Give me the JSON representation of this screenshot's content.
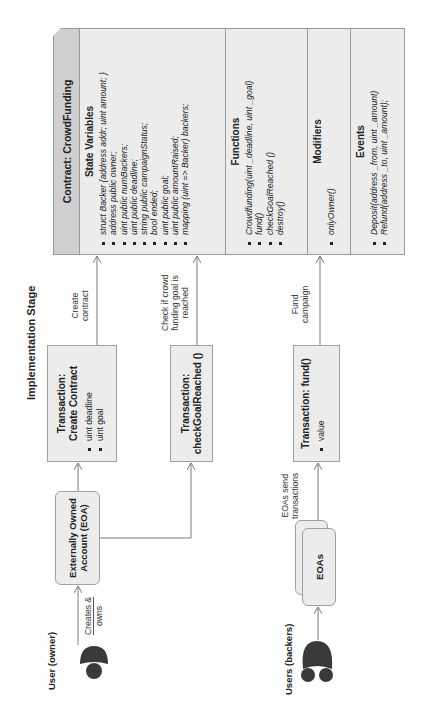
{
  "title": "Implementation Stage",
  "contract": {
    "header": "Contract: CrowdFunding",
    "sections": [
      {
        "title": "State Variables",
        "items": [
          "struct Backer {address addr;  uint amount; }",
          "address public owner;",
          "uint public numBackers;",
          "uint public deadline;",
          "string public campaignStatus;",
          "bool ended;",
          "uint public goal;",
          "uint public amountRaised;",
          "mapping (uint => Backer) backers;"
        ]
      },
      {
        "title": "Functions",
        "items": [
          "Crowdfunding(uint _deadline, uint _goal)",
          "fund()",
          "checkGoalReached ()",
          "destroy()"
        ]
      },
      {
        "title": "Modifiers",
        "items": [
          "onlyOwner()"
        ]
      },
      {
        "title": "Events",
        "items": [
          "Deposit(address _from, uint _amount)",
          "Refund(address _to, uint _amount);"
        ]
      }
    ]
  },
  "transactions": {
    "create": {
      "title_line1": "Transaction:",
      "title_line2": "Create Contract",
      "params": [
        "uint deadline",
        "uint goal"
      ]
    },
    "check": {
      "title_line1": "Transaction:",
      "title_line2": "checkGoalReached ()"
    },
    "fund": {
      "title": "Transaction: fund()",
      "params": [
        "value"
      ]
    }
  },
  "arrow_labels": {
    "create_contract": [
      "Create",
      "contract"
    ],
    "check_goal": [
      "Check if crowd",
      "funding goal is",
      "reached"
    ],
    "fund_campaign": [
      "Fund",
      "campaign"
    ],
    "creates_owns": [
      "Creates &",
      "owns"
    ],
    "eoas_send": [
      "EOAs send",
      "transactions"
    ]
  },
  "eoa": {
    "line1": "Externally Owned",
    "line2": "Account (EOA)"
  },
  "eoas": {
    "label": "EOAs"
  },
  "actors": {
    "owner": {
      "label": "User (owner)",
      "icon": "person-icon"
    },
    "backers": {
      "label": "Users (backers)",
      "icon": "people-group-icon"
    }
  },
  "colors": {
    "box_fill": "#ececec",
    "header_fill": "#cfcfcf",
    "border": "#9a9a9a",
    "icon": "#3a3a3a",
    "line": "#7a7a7a"
  }
}
